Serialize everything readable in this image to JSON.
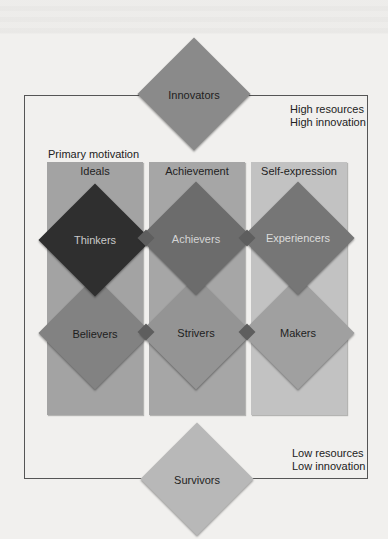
{
  "diagram": {
    "type": "segmentation-framework",
    "frame": {
      "top_right_label": "High resources\nHigh innovation",
      "bottom_right_label": "Low resources\nLow innovation"
    },
    "primary_motivation_label": "Primary motivation",
    "columns": [
      {
        "label": "Ideals",
        "color": "#a3a3a3"
      },
      {
        "label": "Achievement",
        "color": "#a6a6a6"
      },
      {
        "label": "Self-expression",
        "color": "#c2c2c2"
      }
    ],
    "segments": {
      "top": {
        "label": "Innovators",
        "color": "#8a8a8a",
        "text_color": "#1e1e1e"
      },
      "row_high": [
        {
          "label": "Thinkers",
          "color": "#2f2f2f",
          "text_color": "#c9c9c9"
        },
        {
          "label": "Achievers",
          "color": "#6c6c6c",
          "text_color": "#d4d4d4"
        },
        {
          "label": "Experiencers",
          "color": "#767676",
          "text_color": "#dcdcdc"
        }
      ],
      "row_low": [
        {
          "label": "Believers",
          "color": "#828282",
          "text_color": "#1e1e1e"
        },
        {
          "label": "Strivers",
          "color": "#949494",
          "text_color": "#1e1e1e"
        },
        {
          "label": "Makers",
          "color": "#a0a0a0",
          "text_color": "#1e1e1e"
        }
      ],
      "bottom": {
        "label": "Survivors",
        "color": "#b8b8b8",
        "text_color": "#1e1e1e"
      }
    },
    "overlap_color": "#5e5e5e"
  }
}
